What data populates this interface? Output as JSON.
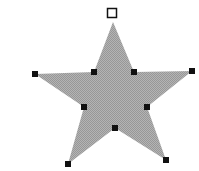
{
  "canvas": {
    "width": 199,
    "height": 171,
    "background": "#ffffff"
  },
  "shape": {
    "type": "star",
    "points": 5,
    "fill": "#a6a6a6",
    "stroke": "none",
    "vertices": [
      [
        113,
        22
      ],
      [
        134,
        72
      ],
      [
        192,
        71
      ],
      [
        147,
        107
      ],
      [
        166,
        160
      ],
      [
        115,
        128
      ],
      [
        68,
        164
      ],
      [
        84,
        107
      ],
      [
        35,
        74
      ],
      [
        94,
        72
      ]
    ]
  },
  "handles": {
    "color": "#111111",
    "size": 6,
    "rotation_handle": {
      "x": 112,
      "y": 13,
      "size": 9,
      "style": "hollow"
    },
    "points": [
      [
        35,
        74
      ],
      [
        94,
        72
      ],
      [
        134,
        72
      ],
      [
        192,
        71
      ],
      [
        84,
        107
      ],
      [
        147,
        107
      ],
      [
        115,
        128
      ],
      [
        68,
        164
      ],
      [
        166,
        160
      ]
    ]
  }
}
